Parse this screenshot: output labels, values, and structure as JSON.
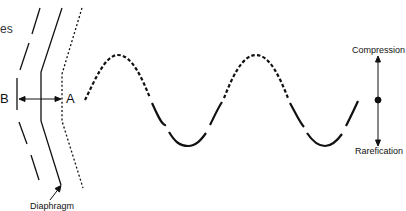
{
  "labels": {
    "partial_text": "es",
    "point_b": "B",
    "point_a": "A",
    "diaphragm": "Diaphragm",
    "compression": "Compression",
    "rarefication": "Rarefication"
  },
  "diagram": {
    "line_color": "#111111",
    "wave": {
      "cycles": 2,
      "crest_style": "dashed",
      "trough_style": "solid"
    }
  }
}
